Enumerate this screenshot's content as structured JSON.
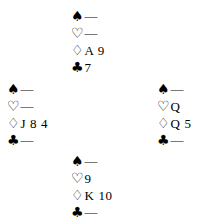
{
  "diagram": {
    "type": "bridge-hand-diagram",
    "void_symbol": "—",
    "suits": [
      {
        "key": "spades",
        "symbol": "♠",
        "fill": "black",
        "name": "spade-suit-symbol"
      },
      {
        "key": "hearts",
        "symbol": "♡",
        "fill": "white",
        "name": "heart-suit-symbol"
      },
      {
        "key": "diamonds",
        "symbol": "♢",
        "fill": "white",
        "name": "diamond-suit-symbol"
      },
      {
        "key": "clubs",
        "symbol": "♣",
        "fill": "black",
        "name": "club-suit-symbol"
      }
    ],
    "hands": {
      "north": {
        "position": "North",
        "spades": "—",
        "hearts": "—",
        "diamonds": "A 9",
        "clubs": "7"
      },
      "west": {
        "position": "West",
        "spades": "—",
        "hearts": "—",
        "diamonds": "J 8 4",
        "clubs": "—"
      },
      "east": {
        "position": "East",
        "spades": "—",
        "hearts": "Q",
        "diamonds": "Q 5",
        "clubs": "—"
      },
      "south": {
        "position": "South",
        "spades": "—",
        "hearts": "9",
        "diamonds": "K 10",
        "clubs": "—"
      }
    }
  },
  "colors": {
    "background": "#ffffff",
    "ink": "#000000"
  }
}
